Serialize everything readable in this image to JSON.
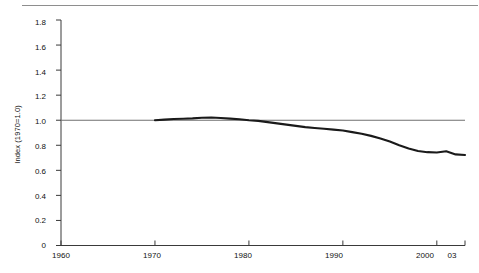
{
  "chart_data": {
    "type": "line",
    "title": "",
    "subtitle": "",
    "xlabel": "",
    "ylabel": "Index (1970=1.0)",
    "grid": false,
    "legend": null,
    "xlim": [
      1960,
      2003
    ],
    "ylim": [
      0,
      1.8
    ],
    "yticks": [
      "0",
      "0.2",
      "0.4",
      "0.6",
      "0.8",
      "1.0",
      "1.2",
      "1.4",
      "1.6",
      "1.8"
    ],
    "ytick_values": [
      0,
      0.2,
      0.4,
      0.6,
      0.8,
      1.0,
      1.2,
      1.4,
      1.6,
      1.8
    ],
    "xticks": [
      "1960",
      "1970",
      "1980",
      "1990",
      "2000",
      "03"
    ],
    "xtick_values": [
      1960,
      1970,
      1980,
      1990,
      2000,
      2003
    ],
    "reference_line": {
      "name": "index-1.0-reference-line",
      "value": 1.0,
      "color": "#6f6f6f",
      "x_start": 1960,
      "x_end": 2003
    },
    "series": [
      {
        "name": "index",
        "color": "#1a1a1a",
        "x": [
          1970,
          1971,
          1972,
          1973,
          1974,
          1975,
          1976,
          1977,
          1978,
          1979,
          1980,
          1981,
          1982,
          1983,
          1984,
          1985,
          1986,
          1987,
          1988,
          1989,
          1990,
          1991,
          1992,
          1993,
          1994,
          1995,
          1996,
          1997,
          1998,
          1999,
          2000,
          2001,
          2002,
          2003
        ],
        "values": [
          1.0,
          1.005,
          1.01,
          1.012,
          1.015,
          1.02,
          1.022,
          1.018,
          1.013,
          1.008,
          1.0,
          0.995,
          0.985,
          0.975,
          0.965,
          0.955,
          0.945,
          0.938,
          0.932,
          0.925,
          0.918,
          0.905,
          0.892,
          0.875,
          0.855,
          0.83,
          0.8,
          0.775,
          0.755,
          0.745,
          0.742,
          0.752,
          0.727,
          0.722
        ]
      }
    ]
  },
  "axes": {
    "y_axis_label": "Index (1970=1.0)"
  }
}
